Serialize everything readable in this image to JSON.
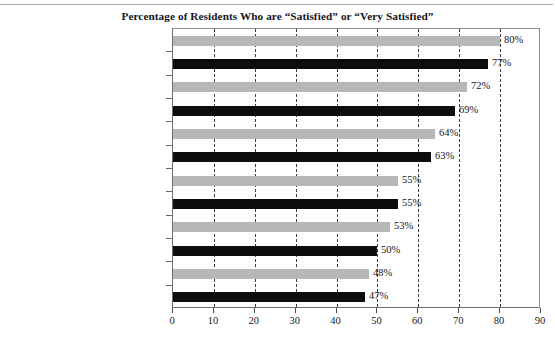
{
  "chart_data": {
    "type": "bar",
    "orientation": "horizontal",
    "title": "Percentage of Residents Who are “Satisfied” or “Very Satisfied”",
    "xlabel": "",
    "ylabel": "",
    "xlim": [
      0,
      90
    ],
    "xticks": [
      0,
      10,
      20,
      30,
      40,
      50,
      60,
      70,
      80,
      90
    ],
    "xtick_labels": [
      "0",
      "10",
      "20",
      "30",
      "40",
      "50",
      "60",
      "70",
      "80",
      "90"
    ],
    "grid": "vertical-dashed",
    "legend": "none",
    "categories": [
      "Police/Fire/EMS",
      "Trash/Yard Waste Services",
      "Wastewater Utilities",
      "Parks/Recreation",
      "Stormwater Management",
      "Emergency Preparedness",
      "Traffic/Congestion",
      "Customer Service",
      "Code/Ordinance Enforcement",
      "Communication",
      "Streets/Sidewalks/Infrastructure",
      "Public Transportation"
    ],
    "values": [
      80,
      77,
      72,
      69,
      64,
      63,
      55,
      55,
      53,
      50,
      48,
      47
    ],
    "data_labels": [
      "80%",
      "77%",
      "72%",
      "69%",
      "64%",
      "63%",
      "55%",
      "55%",
      "53%",
      "50%",
      "48%",
      "47%"
    ],
    "bar_colors": [
      "#b7b7b7",
      "#0d0d0d",
      "#b7b7b7",
      "#0d0d0d",
      "#b7b7b7",
      "#0d0d0d",
      "#b7b7b7",
      "#0d0d0d",
      "#b7b7b7",
      "#0d0d0d",
      "#b7b7b7",
      "#0d0d0d"
    ],
    "colors": {
      "gray_bar": "#b7b7b7",
      "black_bar": "#0d0d0d",
      "gridline": "#3b3b40",
      "axis": "#6e6e72",
      "background": "#ffffff",
      "text": "#15151a"
    }
  }
}
